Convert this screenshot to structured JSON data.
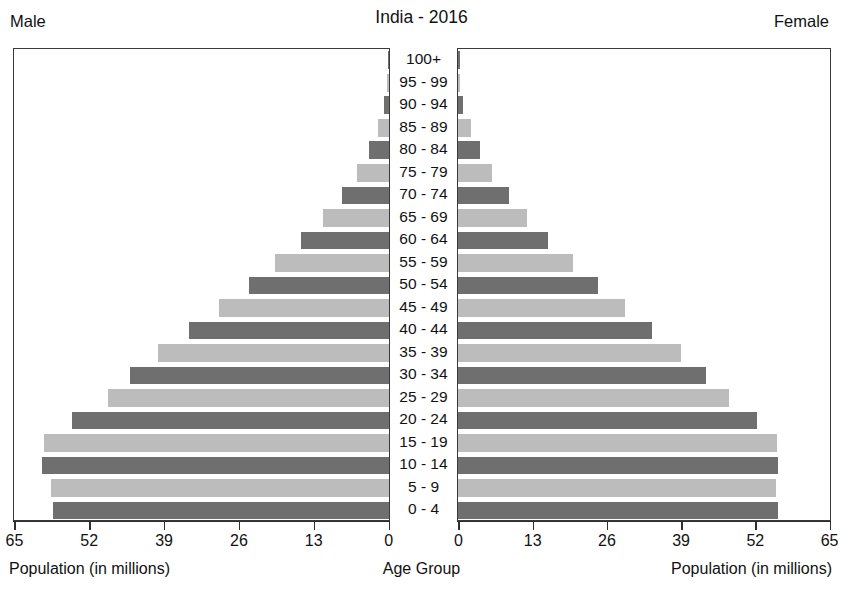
{
  "header": {
    "title": "India - 2016",
    "male_label": "Male",
    "female_label": "Female"
  },
  "captions": {
    "left_axis": "Population (in millions)",
    "center_axis": "Age Group",
    "right_axis": "Population (in millions)"
  },
  "chart_data": {
    "type": "bar",
    "subtype": "population-pyramid",
    "title": "India - 2016",
    "xlabel": "Population (in millions)",
    "ylabel": "Age Group",
    "xlim": [
      0,
      65
    ],
    "grid": false,
    "legend": false,
    "left_side_label": "Male",
    "right_side_label": "Female",
    "left_tick_labels": [
      "65",
      "52",
      "39",
      "26",
      "13",
      "0"
    ],
    "right_tick_labels": [
      "0",
      "13",
      "26",
      "39",
      "52",
      "65"
    ],
    "tick_values": [
      0,
      13,
      26,
      39,
      52,
      65
    ],
    "bar_colors": {
      "dark": "#6f6f6f",
      "light": "#bcbcbc"
    },
    "categories": [
      "100+",
      "95 - 99",
      "90 - 94",
      "85 - 89",
      "80 - 84",
      "75 - 79",
      "70 - 74",
      "65 - 69",
      "60 - 64",
      "55 - 59",
      "50 - 54",
      "45 - 49",
      "40 - 44",
      "35 - 39",
      "30 - 34",
      "25 - 29",
      "20 - 24",
      "15 - 19",
      "10 - 14",
      "5 - 9",
      "0 - 4"
    ],
    "series": [
      {
        "name": "Male",
        "values": [
          0.2,
          0.4,
          0.8,
          1.9,
          3.4,
          5.6,
          8.2,
          11.5,
          15.3,
          19.8,
          24.4,
          29.6,
          34.8,
          40.2,
          45.0,
          48.8,
          55.0,
          60.0,
          60.2,
          58.8,
          58.3
        ]
      },
      {
        "name": "Female",
        "values": [
          0.2,
          0.4,
          0.9,
          2.2,
          3.8,
          5.9,
          8.9,
          12.1,
          15.8,
          20.2,
          24.6,
          29.3,
          33.9,
          39.0,
          43.5,
          47.5,
          52.4,
          55.9,
          56.0,
          55.7,
          56.0
        ]
      }
    ]
  }
}
